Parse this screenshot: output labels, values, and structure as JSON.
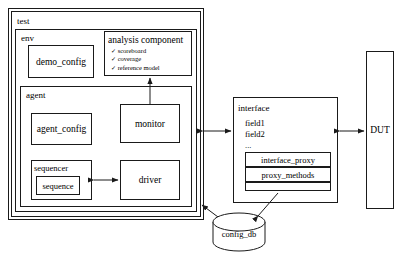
{
  "diagram": {
    "type": "block-diagram",
    "stroke_color": "#1a1a1a",
    "background_color": "#ffffff"
  },
  "test": {
    "label": "test"
  },
  "env": {
    "label": "env"
  },
  "agent": {
    "label": "agent"
  },
  "demo_config": {
    "label": "demo_config"
  },
  "analysis_component": {
    "label": "analysis component",
    "items": [
      {
        "check": "✓",
        "label": "scoreboard"
      },
      {
        "check": "✓",
        "label": "coverage"
      },
      {
        "check": "✓",
        "label": "reference model"
      }
    ]
  },
  "agent_config": {
    "label": "agent_config"
  },
  "monitor": {
    "label": "monitor"
  },
  "sequencer": {
    "label": "sequencer"
  },
  "sequence": {
    "label": "sequence"
  },
  "driver": {
    "label": "driver"
  },
  "interface": {
    "label": "interface",
    "fields": [
      "field1",
      "field2",
      "..."
    ],
    "proxy_rows": [
      "interface_proxy",
      "proxy_methods",
      ""
    ]
  },
  "dut": {
    "label": "DUT"
  },
  "config_db": {
    "label": "config_db"
  },
  "connections": [
    {
      "from": "monitor",
      "to": "analysis_component",
      "style": "arrow-up"
    },
    {
      "from": "sequencer",
      "to": "driver",
      "style": "bidirectional"
    },
    {
      "from": "env",
      "to": "interface",
      "style": "bidirectional"
    },
    {
      "from": "interface",
      "to": "dut",
      "style": "bidirectional"
    },
    {
      "from": "config_db",
      "to": "test",
      "style": "arrow"
    },
    {
      "from": "config_db",
      "to": "interface_proxy",
      "style": "arrow"
    }
  ]
}
